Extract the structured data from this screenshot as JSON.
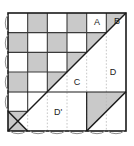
{
  "figure": {
    "canvas": {
      "width": 134,
      "height": 146
    },
    "square": {
      "x": 8,
      "y": 13,
      "width": 118,
      "height": 118,
      "cell": 19.6667,
      "cols": 6,
      "rows": 6
    },
    "colors": {
      "background": "#ffffff",
      "shaded_cell": "#c9c9c9",
      "plain_cell": "#ffffff",
      "grid_line": "#3a3a3a",
      "border_line": "#1a1a1a",
      "dotted_line": "#b0b0b0",
      "diagonal_line": "#1a1a1a",
      "label_text": "#1a1a1a"
    },
    "labels": [
      {
        "id": "label-a",
        "text": "A",
        "x": 97,
        "y": 23
      },
      {
        "id": "label-b",
        "text": "B",
        "x": 117,
        "y": 22
      },
      {
        "id": "label-c",
        "text": "C",
        "x": 77,
        "y": 83
      },
      {
        "id": "label-d",
        "text": "D",
        "x": 113,
        "y": 73
      },
      {
        "id": "label-d-prime",
        "text": "D'",
        "x": 58,
        "y": 113
      }
    ],
    "checker_shaded_cells": [
      [
        0,
        1
      ],
      [
        0,
        3
      ],
      [
        0,
        5
      ],
      [
        1,
        0
      ],
      [
        1,
        2
      ],
      [
        1,
        4
      ],
      [
        2,
        1
      ],
      [
        2,
        3
      ],
      [
        3,
        0
      ],
      [
        3,
        2
      ],
      [
        3,
        3
      ],
      [
        5,
        0
      ]
    ],
    "diagonals": [
      {
        "id": "main-diagonal",
        "from": [
          8,
          131
        ],
        "to": [
          126,
          13
        ]
      },
      {
        "id": "lower-right-diagonal",
        "from": [
          87,
          131
        ],
        "to": [
          126,
          92
        ]
      },
      {
        "id": "small-corner-diagonal",
        "from": [
          8,
          131
        ],
        "to": [
          28,
          111
        ]
      }
    ],
    "solid_rules": [
      {
        "id": "row-rule-4",
        "from": [
          8,
          92
        ],
        "to": [
          126,
          92
        ]
      },
      {
        "id": "col-rule-right",
        "from": [
          87,
          92
        ],
        "to": [
          87,
          131
        ]
      }
    ],
    "dotted_guides_x": [
      28,
      48,
      67,
      87,
      106
    ],
    "scallops": {
      "left_count": 5,
      "bottom_count": 6,
      "note": "small arc ticks along left edge and bottom edge"
    }
  }
}
